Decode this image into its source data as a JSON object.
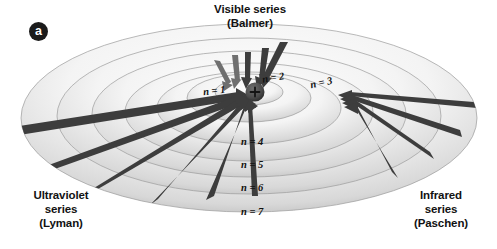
{
  "figure": {
    "panel_label": "a",
    "background_color": "#ffffff"
  },
  "captions": {
    "visible": "Visible series\n(Balmer)",
    "ultraviolet": "Ultraviolet\nseries\n(Lyman)",
    "infrared": "Infrared\nseries\n(Paschen)"
  },
  "nucleus": {
    "charge_symbol": "+",
    "fill_color": "#4a4a4a"
  },
  "orbits": [
    {
      "label": "n = 1",
      "n": 1,
      "rx": 34,
      "ry": 13,
      "label_x": 205,
      "label_y": 84,
      "label_rotate": -6
    },
    {
      "label": "n = 2",
      "n": 2,
      "rx": 62,
      "ry": 24,
      "label_x": 262,
      "label_y": 72,
      "label_rotate": -10
    },
    {
      "label": "n = 3",
      "n": 3,
      "rx": 92,
      "ry": 36,
      "label_x": 309,
      "label_y": 76,
      "label_rotate": -12
    },
    {
      "label": "n = 4",
      "n": 4,
      "rx": 124,
      "ry": 49,
      "label_x": 243,
      "label_y": 137,
      "label_rotate": 0
    },
    {
      "label": "n = 5",
      "n": 5,
      "rx": 157,
      "ry": 63,
      "label_x": 243,
      "label_y": 160,
      "label_rotate": 0
    },
    {
      "label": "n = 6",
      "n": 6,
      "rx": 192,
      "ry": 78,
      "label_x": 243,
      "label_y": 183,
      "label_rotate": 0
    },
    {
      "label": "n = 7",
      "n": 7,
      "rx": 228,
      "ry": 94,
      "label_x": 243,
      "label_y": 207,
      "label_rotate": 0
    }
  ],
  "transition_series": [
    {
      "name": "Lyman",
      "region": "Ultraviolet",
      "target_level": 1,
      "direction": "inward-from-lower-left",
      "arrow_color": "#3d3d3d",
      "arrow_count": 6
    },
    {
      "name": "Balmer",
      "region": "Visible",
      "target_level": 2,
      "direction": "inward-from-top",
      "arrow_color": "#3d3d3d",
      "arrow_count": 5
    },
    {
      "name": "Paschen",
      "region": "Infrared",
      "target_level": 3,
      "direction": "inward-from-right",
      "arrow_color": "#3d3d3d",
      "arrow_count": 4
    }
  ]
}
